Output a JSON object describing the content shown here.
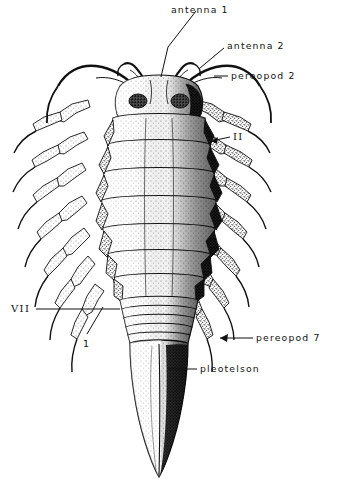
{
  "figure": {
    "kind": "scientific-illustration",
    "style": "pen-and-ink stipple",
    "ink_color": "#101010",
    "paper_color": "#ffffff",
    "mid_tone": "#8d8d8d",
    "dark_tone": "#262626"
  },
  "labels": {
    "antenna_1": "antenna 1",
    "antenna_2": "antenna 2",
    "pereopod_2": "pereopod 2",
    "segment_ii": "II",
    "segment_vii": "VII",
    "pleon_1": "1",
    "pereopod_7": "pereopod 7",
    "pleotelson": "pleotelson"
  },
  "anatomy": {
    "head": "cephalon with paired compound eyes",
    "antennae_pairs": 2,
    "pereonites": 7,
    "pereopod_pairs": 7,
    "pleonites": 5,
    "telson": "pleotelson, elongate and acuminate"
  }
}
